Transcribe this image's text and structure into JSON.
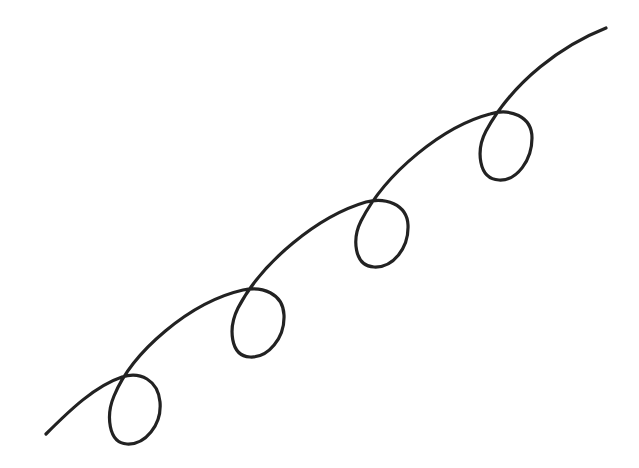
{
  "illustration": {
    "title": "",
    "description": "Looped curly line rising from lower-left to upper-right",
    "stroke_color": "#222222",
    "background_color": "#ffffff",
    "loop_count": 4
  }
}
